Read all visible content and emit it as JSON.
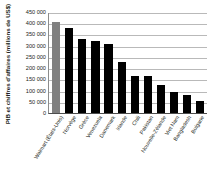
{
  "chart_data": {
    "type": "bar",
    "title": "",
    "xlabel": "",
    "ylabel": "PIB et chiffres d'affaires (millions de US$)",
    "ylim": [
      0,
      450000
    ],
    "ytick_step": 50000,
    "ytick_labels": [
      "450 000",
      "400 000",
      "350 000",
      "300 000",
      "250 000",
      "200 000",
      "150 000",
      "100 000",
      "50 000",
      "0"
    ],
    "ytick_values": [
      450000,
      400000,
      350000,
      300000,
      250000,
      200000,
      150000,
      100000,
      50000,
      0
    ],
    "grid": true,
    "legend": "none",
    "categories": [
      "Walmart (États-Unis)",
      "Norvège",
      "Grèce",
      "Venezuela",
      "Danemark",
      "Irlande",
      "Chili",
      "Pakistan",
      "Nouvelle-Zélande",
      "Viet Nam",
      "Bangladesh",
      "Bulgarie"
    ],
    "values": [
      405000,
      379000,
      329000,
      323000,
      309000,
      227000,
      163000,
      163000,
      127000,
      92000,
      82000,
      53000
    ],
    "bar_colors": [
      "#808080",
      "#000000",
      "#000000",
      "#000000",
      "#000000",
      "#000000",
      "#000000",
      "#000000",
      "#000000",
      "#000000",
      "#000000",
      "#000000"
    ],
    "highlight_index": 0,
    "axis_color": "#4d4d4d",
    "grid_color": "#b9b9b9"
  }
}
